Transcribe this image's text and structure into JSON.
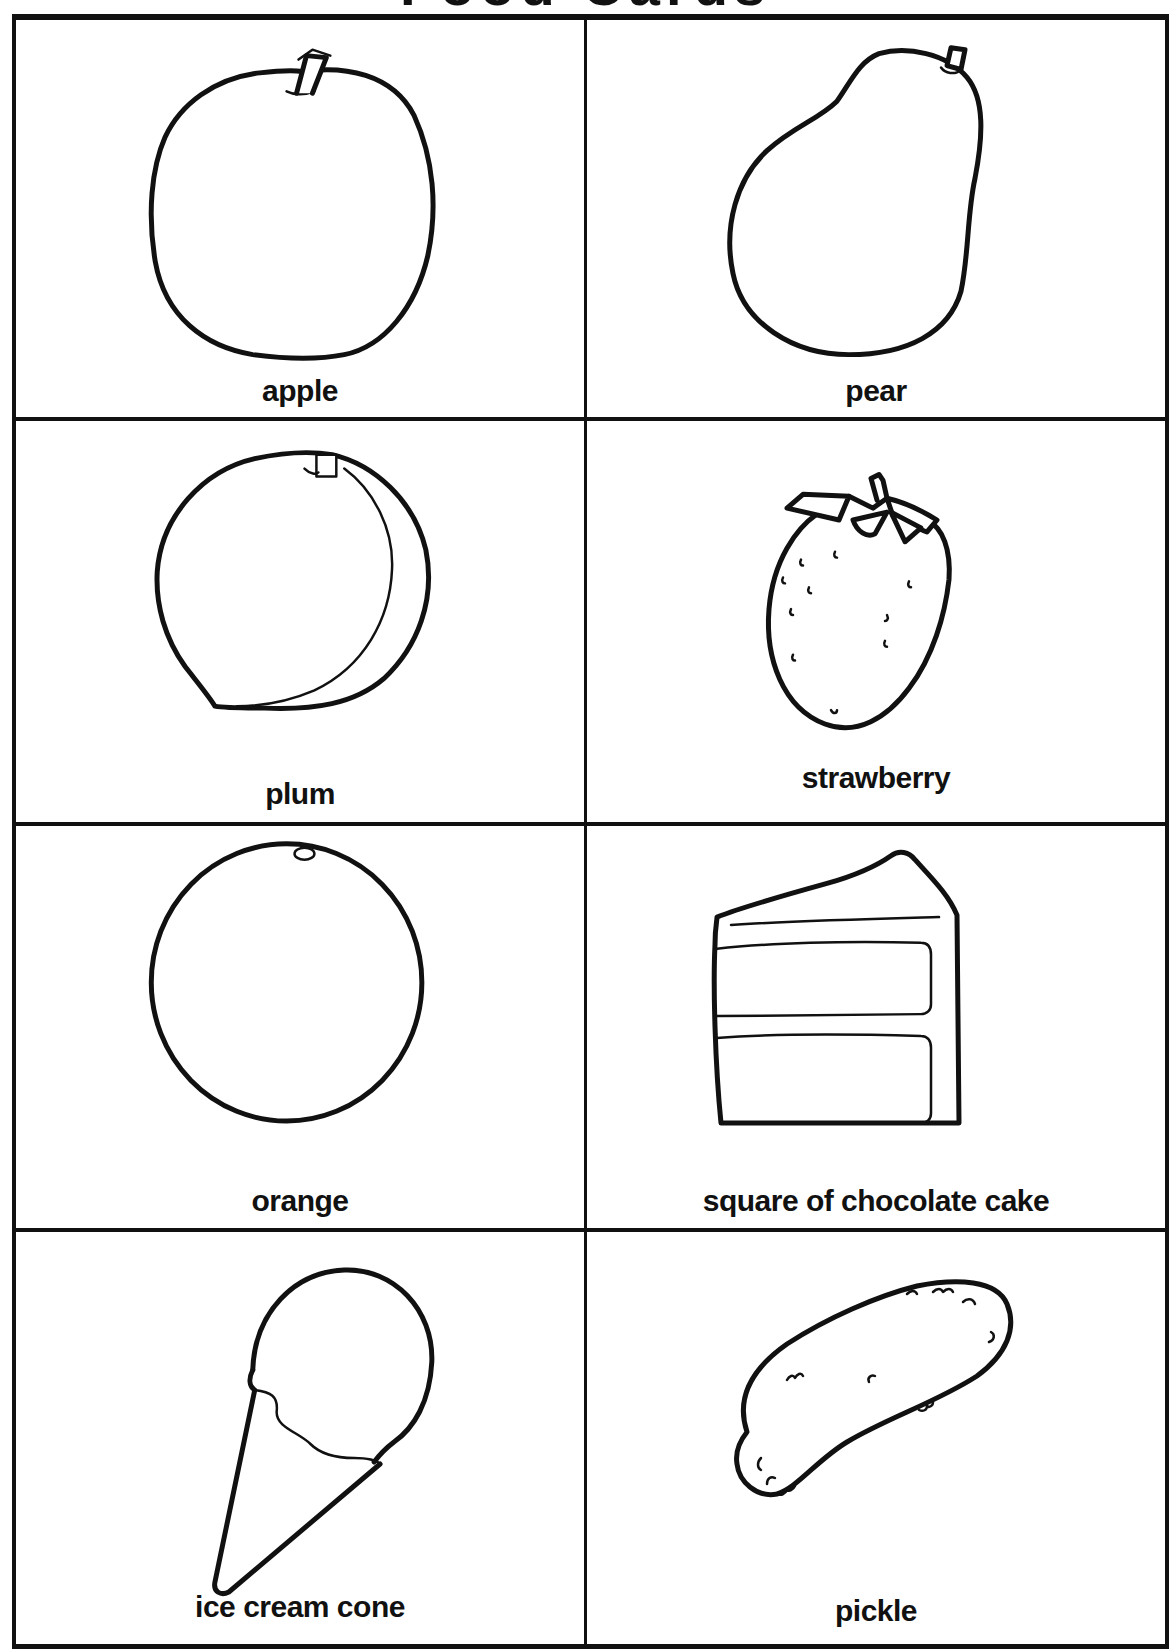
{
  "page": {
    "title": "Food Cards",
    "title_visibility": "cut-off at top edge (only glyph bottoms visible)"
  },
  "cards": [
    {
      "label": "apple",
      "icon": "apple-icon",
      "row": 1,
      "col": 1
    },
    {
      "label": "pear",
      "icon": "pear-icon",
      "row": 1,
      "col": 2
    },
    {
      "label": "plum",
      "icon": "plum-icon",
      "row": 2,
      "col": 1
    },
    {
      "label": "strawberry",
      "icon": "strawberry-icon",
      "row": 2,
      "col": 2
    },
    {
      "label": "orange",
      "icon": "orange-icon",
      "row": 3,
      "col": 1
    },
    {
      "label": "square of chocolate cake",
      "icon": "cake-slice-icon",
      "row": 3,
      "col": 2
    },
    {
      "label": "ice cream cone",
      "icon": "ice-cream-cone-icon",
      "row": 4,
      "col": 1
    },
    {
      "label": "pickle",
      "icon": "pickle-icon",
      "row": 4,
      "col": 2
    }
  ],
  "style": {
    "ink_color": "#111111",
    "paper_color": "#ffffff"
  }
}
